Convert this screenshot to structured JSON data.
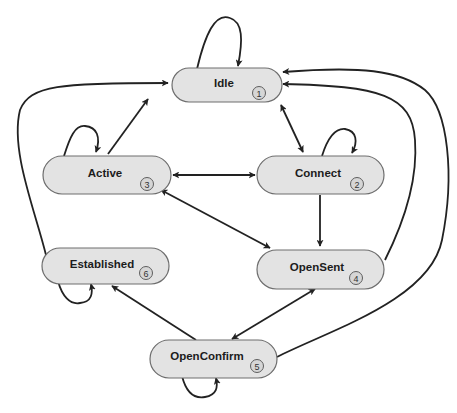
{
  "diagram": {
    "type": "state-machine",
    "colors": {
      "node_fill": "#e3e3e3",
      "node_stroke": "#6e6e6e",
      "badge_fill": "#d6d6d6",
      "edge": "#222222",
      "background": "#ffffff"
    },
    "states": [
      {
        "id": "idle",
        "label": "Idle",
        "number": "1"
      },
      {
        "id": "connect",
        "label": "Connect",
        "number": "2"
      },
      {
        "id": "active",
        "label": "Active",
        "number": "3"
      },
      {
        "id": "opensent",
        "label": "OpenSent",
        "number": "4"
      },
      {
        "id": "openconfirm",
        "label": "OpenConfirm",
        "number": "5"
      },
      {
        "id": "established",
        "label": "Established",
        "number": "6"
      }
    ],
    "transitions": [
      {
        "from": "idle",
        "to": "idle",
        "kind": "self-loop"
      },
      {
        "from": "idle",
        "to": "connect",
        "kind": "bidirectional"
      },
      {
        "from": "active",
        "to": "idle",
        "kind": "directed"
      },
      {
        "from": "active",
        "to": "active",
        "kind": "self-loop"
      },
      {
        "from": "active",
        "to": "connect",
        "kind": "bidirectional"
      },
      {
        "from": "connect",
        "to": "connect",
        "kind": "self-loop"
      },
      {
        "from": "connect",
        "to": "opensent",
        "kind": "directed"
      },
      {
        "from": "active",
        "to": "opensent",
        "kind": "bidirectional"
      },
      {
        "from": "opensent",
        "to": "idle",
        "kind": "directed"
      },
      {
        "from": "openconfirm",
        "to": "idle",
        "kind": "directed"
      },
      {
        "from": "established",
        "to": "idle",
        "kind": "directed"
      },
      {
        "from": "established",
        "to": "established",
        "kind": "self-loop"
      },
      {
        "from": "openconfirm",
        "to": "established",
        "kind": "directed"
      },
      {
        "from": "opensent",
        "to": "openconfirm",
        "kind": "bidirectional"
      },
      {
        "from": "openconfirm",
        "to": "openconfirm",
        "kind": "self-loop"
      }
    ]
  }
}
